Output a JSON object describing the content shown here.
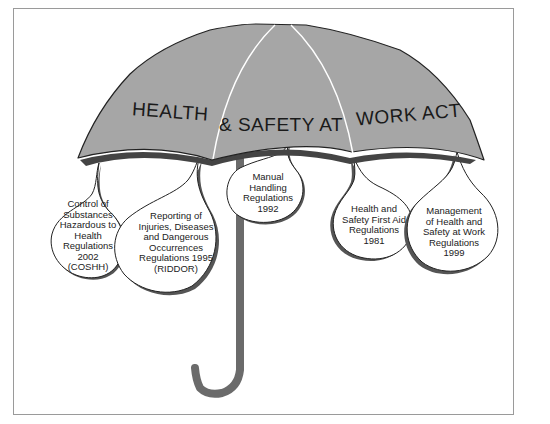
{
  "diagram": {
    "title_words": [
      "HEALTH",
      "& SAFETY AT",
      "WORK ACT"
    ],
    "title_full": "HEALTH & SAFETY AT WORK ACT",
    "canopy_color": "#a6a6a6",
    "handle_color": "#6b6b6b",
    "outline_color": "#222222",
    "regulations": [
      {
        "lines": [
          "Control of",
          "Substances",
          "Hazardous to",
          "Health",
          "Regulations",
          "2002",
          "(COSHH)"
        ]
      },
      {
        "lines": [
          "Reporting of",
          "Injuries, Diseases",
          "and Dangerous",
          "Occurrences",
          "Regulations 1995",
          "(RIDDOR)"
        ]
      },
      {
        "lines": [
          "Manual",
          "Handling",
          "Regulations",
          "1992"
        ]
      },
      {
        "lines": [
          "Health and",
          "Safety First Aid",
          "Regulations",
          "1981"
        ]
      },
      {
        "lines": [
          "Management",
          "of Health and",
          "Safety at Work",
          "Regulations",
          "1999"
        ]
      }
    ]
  }
}
